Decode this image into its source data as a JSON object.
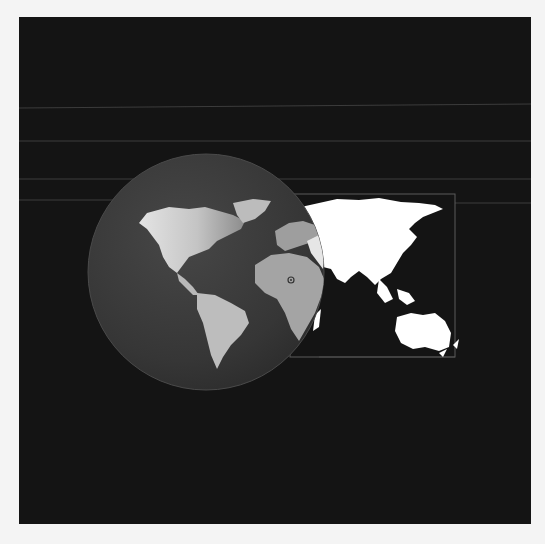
{
  "image": {
    "description": "World map illustration: a shaded globe showing the Americas, Europe and Africa, with a flat bright map of Asia and Australia extending to the right inside a thin rectangular frame, on a dark background with faint horizontal lines",
    "colors": {
      "page_background": "#f4f4f4",
      "panel_background": "#141414",
      "globe_fill": "#3a3a3a",
      "globe_land_light": "#d8d8d8",
      "globe_land_dim": "#9a9a9a",
      "flat_map_land": "#ffffff",
      "frame_line": "#5a5a5a",
      "guide_line": "#3c3c3c"
    },
    "elements": {
      "globe_label": "Globe (Americas, Europe, Africa)",
      "flat_map_label": "Flat map (Asia, Australia)"
    }
  }
}
